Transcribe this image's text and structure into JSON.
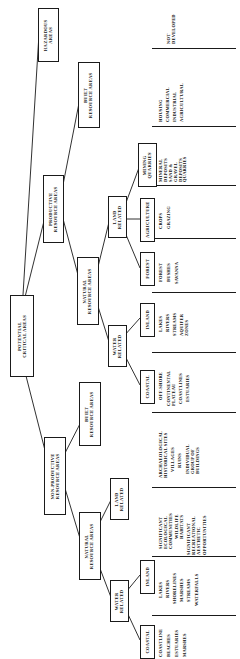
{
  "diagram": {
    "title": "POTENTIAL CRITICAL AREAS",
    "orientation": "rotated-90-ccw tree",
    "root": {
      "label_line1": "POTENTIAL",
      "label_line2": "CRITICAL AREAS"
    },
    "nodes": {
      "hazardous": {
        "line1": "HAZARDOUS",
        "line2": "AREAS"
      },
      "productive": {
        "line1": "PRODUCTIVE",
        "line2": "RESOURCE AREAS"
      },
      "nonproductive": {
        "line1": "NON-PRODUCTIVE",
        "line2": "RESOURCE AREAS"
      },
      "built_prod": {
        "line1": "BUILT",
        "line2": "RESOURCE AREAS"
      },
      "natural_prod": {
        "line1": "NATURAL",
        "line2": "RESOURCE AREAS"
      },
      "built_nonprod": {
        "line1": "BUILT",
        "line2": "RESOURCE AREAS"
      },
      "natural_nonprod": {
        "line1": "NATURAL",
        "line2": "RESOURCE AREAS"
      },
      "land_prod": {
        "line1": "LAND",
        "line2": "RELATED"
      },
      "water_prod": {
        "line1": "WATER",
        "line2": "RELATED"
      },
      "land_nonprod": {
        "line1": "LAND",
        "line2": "RELATED"
      },
      "water_nonprod": {
        "line1": "WATER",
        "line2": "RELATED"
      },
      "mining": {
        "line1": "MINING",
        "line2": "QUARRIES"
      },
      "agriculture": {
        "line1": "AGRICULTURE",
        "line2": ""
      },
      "forest": {
        "line1": "FOREST",
        "line2": ""
      },
      "inland_prod": {
        "line1": "INLAND",
        "line2": ""
      },
      "coastal_prod": {
        "line1": "COASTAL",
        "line2": ""
      },
      "inland_nonprod": {
        "line1": "INLAND",
        "line2": ""
      },
      "coastal_nonprod": {
        "line1": "COASTAL",
        "line2": ""
      }
    },
    "leaf_groups": {
      "hazardous_leaves": {
        "items": [
          "NOT",
          "DEVELOPED"
        ]
      },
      "built_prod_leaves": {
        "items": [
          "HOUSING",
          "COMMERCIAL",
          "INDUSTRIAL",
          "AGRICULTURAL"
        ]
      },
      "mining_leaves": {
        "items": [
          "MINERAL",
          "DEPOSITS",
          "SAND &",
          "GRAVEL",
          "DEPOSITS",
          "QUARRIES"
        ]
      },
      "agriculture_leaves": {
        "items": [
          "CROPS",
          "GRAZING"
        ]
      },
      "forest_leaves": {
        "items": [
          "FOREST",
          "BUSHES",
          "SAVANNA"
        ]
      },
      "inland_prod_leaves": {
        "items": [
          "LAKES",
          "RIVERS",
          "STREAMS",
          "AQUIFER",
          "ZONES"
        ]
      },
      "coastal_prod_leaves": {
        "items": [
          "OFF-SHORE",
          "CONTINENTAL",
          "PLATEAU",
          "COASTLINES",
          "ESTUARIES"
        ]
      },
      "built_nonprod_leaves": {
        "items": [
          "ARCHAEOLOGICAL",
          "HISTORICAL SITES",
          "VILLAGES",
          "RUINS",
          "INDIVIDUAL",
          "GROUP OF",
          "BUILDINGS"
        ]
      },
      "land_nonprod_leaves": {
        "items": [
          "SIGNIFICANT",
          "ECOLOGICAL",
          "COMMUNITIES",
          "WILDLIFE",
          "HABITATS",
          "SIGNIFICANT",
          "RECREATIONAL",
          "AESTHETIC",
          "OPPORTUNITIES"
        ]
      },
      "inland_nonprod_leaves": {
        "items": [
          "LAKES",
          "RIVERS",
          "SHORELINES",
          "MARSHES",
          "STREAMS",
          "WATERFALLS"
        ]
      },
      "coastal_nonprod_leaves": {
        "items": [
          "COASTLINE",
          "BEACHES",
          "ESTUARIES",
          "MARSHES"
        ]
      }
    },
    "colors": {
      "ink": "#1a1a1a",
      "paper": "#ffffff"
    }
  }
}
